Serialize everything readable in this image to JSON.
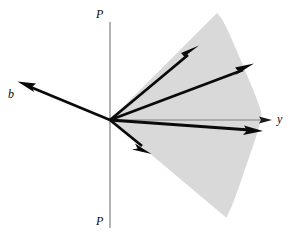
{
  "figure": {
    "width": 295,
    "height": 241,
    "background": "#ffffff"
  },
  "labels": {
    "p_top": "P",
    "p_bottom": "P",
    "y_axis": "y",
    "b_vector": "b"
  },
  "colors": {
    "sector_fill": "#d9d9d9",
    "vector_stroke": "#0a0a0a",
    "axis_stroke": "#808080",
    "background": "#ffffff"
  },
  "chart_data": {
    "type": "diagram",
    "origin": {
      "x": 110,
      "y": 120
    },
    "axes": [
      {
        "name": "P-P vertical line",
        "x1": 110,
        "y1": 22,
        "x2": 110,
        "y2": 228,
        "style": "thin-gray",
        "arrow": false
      },
      {
        "name": "y horizontal axis",
        "x1": 110,
        "y1": 120,
        "x2": 272,
        "y2": 120,
        "style": "thin-gray",
        "arrow": true
      }
    ],
    "sector": {
      "name": "shaded-cone",
      "fill": "#d9d9d9",
      "apex": {
        "x": 110,
        "y": 120
      },
      "angle_start_deg": 45,
      "angle_end_deg": -40,
      "radius": 152,
      "description": "light gray wedge spanning roughly +45 deg above to -40 deg below the y axis"
    },
    "vectors": [
      {
        "name": "vector-b",
        "x1": 110,
        "y1": 120,
        "x2": 18,
        "y2": 82,
        "label": "b",
        "angle_deg": 157
      },
      {
        "name": "vector-1-upper",
        "x1": 110,
        "y1": 120,
        "x2": 198,
        "y2": 46,
        "label": "",
        "angle_deg": 40
      },
      {
        "name": "vector-2-middle",
        "x1": 110,
        "y1": 120,
        "x2": 253,
        "y2": 64,
        "label": "",
        "angle_deg": 21
      },
      {
        "name": "vector-3-lower",
        "x1": 110,
        "y1": 120,
        "x2": 262,
        "y2": 131,
        "label": "",
        "angle_deg": -4
      },
      {
        "name": "vector-4-down",
        "x1": 110,
        "y1": 120,
        "x2": 150,
        "y2": 153,
        "label": "",
        "angle_deg": -39
      }
    ]
  }
}
